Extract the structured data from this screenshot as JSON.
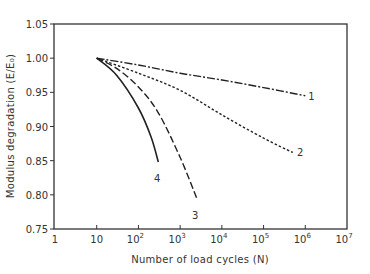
{
  "chart_data": {
    "type": "line",
    "title": "",
    "xlabel": "Number of load cycles (N)",
    "ylabel": "Modulus degradation (E/E₀)",
    "xscale": "log",
    "xlim": [
      1,
      10000000
    ],
    "ylim": [
      0.75,
      1.05
    ],
    "x_ticks": [
      {
        "value": 1,
        "label": "1",
        "sup": ""
      },
      {
        "value": 10,
        "label": "10",
        "sup": ""
      },
      {
        "value": 100,
        "label": "10",
        "sup": "2"
      },
      {
        "value": 1000,
        "label": "10",
        "sup": "3"
      },
      {
        "value": 10000,
        "label": "10",
        "sup": "4"
      },
      {
        "value": 100000,
        "label": "10",
        "sup": "5"
      },
      {
        "value": 1000000,
        "label": "10",
        "sup": "6"
      },
      {
        "value": 10000000,
        "label": "10",
        "sup": "7"
      }
    ],
    "y_ticks": [
      {
        "value": 1.05,
        "label": "1.05"
      },
      {
        "value": 1.0,
        "label": "1.00"
      },
      {
        "value": 0.95,
        "label": "0.95"
      },
      {
        "value": 0.9,
        "label": "0.90"
      },
      {
        "value": 0.85,
        "label": "0.85"
      },
      {
        "value": 0.8,
        "label": "0.80"
      },
      {
        "value": 0.75,
        "label": "0.75"
      }
    ],
    "grid": false,
    "legend": "inline curve labels",
    "series": [
      {
        "name": "1",
        "style": "dash-dot",
        "x": [
          10,
          100,
          1000,
          10000,
          100000,
          1000000
        ],
        "y": [
          1.0,
          0.99,
          0.978,
          0.968,
          0.957,
          0.945
        ],
        "label_pos": [
          1400000,
          0.945
        ]
      },
      {
        "name": "2",
        "style": "dotted",
        "x": [
          10,
          100,
          1000,
          10000,
          100000,
          500000
        ],
        "y": [
          1.0,
          0.978,
          0.953,
          0.917,
          0.883,
          0.862
        ],
        "label_pos": [
          750000,
          0.862
        ]
      },
      {
        "name": "3",
        "style": "dashed",
        "x": [
          10,
          30,
          100,
          300,
          1000,
          2500
        ],
        "y": [
          1.0,
          0.985,
          0.958,
          0.92,
          0.855,
          0.795
        ],
        "label_pos": [
          2300,
          0.77
        ]
      },
      {
        "name": "4",
        "style": "solid",
        "x": [
          10,
          30,
          100,
          200,
          300
        ],
        "y": [
          1.0,
          0.975,
          0.927,
          0.885,
          0.848
        ],
        "label_pos": [
          280,
          0.825
        ]
      }
    ]
  },
  "colors": {
    "line": "#222222",
    "axis": "#333333",
    "text": "#333333",
    "background": "#ffffff"
  }
}
